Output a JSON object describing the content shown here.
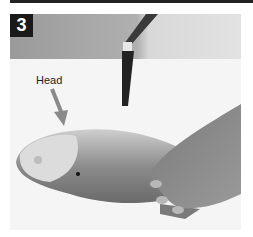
{
  "step": {
    "number": "3"
  },
  "annotation": {
    "label": "Head",
    "arrow_color": "#8a8a8a"
  },
  "photo": {
    "description": "Grayscale photo: fish on cutting board, knife held vertically behind, hand resting on fish body",
    "background_top": "#9c9c9c",
    "background_bottom": "#f4f4f4"
  }
}
